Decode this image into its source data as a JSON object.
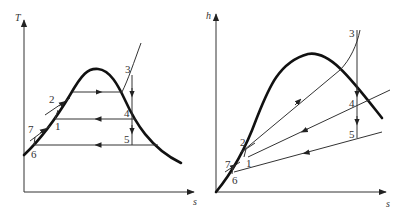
{
  "figures": [
    {
      "id": "T-s",
      "y_axis_label": "T",
      "x_axis_label": "s",
      "state_points": [
        "1",
        "2",
        "3",
        "4",
        "5",
        "6",
        "7"
      ]
    },
    {
      "id": "h-s",
      "y_axis_label": "h",
      "x_axis_label": "s",
      "state_points": [
        "1",
        "2",
        "3",
        "4",
        "5",
        "6",
        "7"
      ]
    }
  ]
}
